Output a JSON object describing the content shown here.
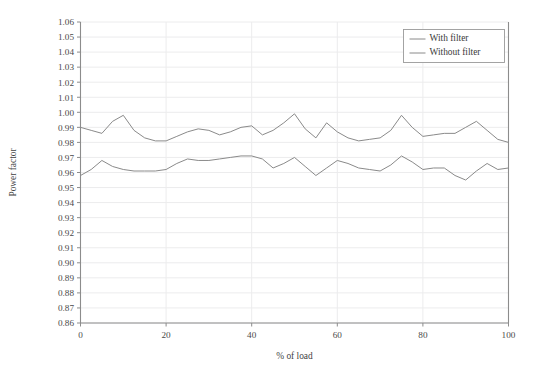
{
  "chart_data": {
    "type": "line",
    "title": "",
    "xlabel": "% of load",
    "ylabel": "Power factor",
    "xlim": [
      0,
      100
    ],
    "ylim": [
      0.86,
      1.06
    ],
    "grid": true,
    "legend_position": "top-right",
    "x_ticks": [
      0,
      20,
      40,
      60,
      80,
      100
    ],
    "x_tick_labels": [
      "0",
      "20",
      "40",
      "60",
      "80",
      "100"
    ],
    "y_ticks": [
      0.86,
      0.87,
      0.88,
      0.89,
      0.9,
      0.91,
      0.92,
      0.93,
      0.94,
      0.95,
      0.96,
      0.97,
      0.98,
      0.99,
      1.0,
      1.01,
      1.02,
      1.03,
      1.04,
      1.05,
      1.06
    ],
    "y_tick_labels": [
      "0.86",
      "0.87",
      "0.88",
      "0.89",
      "0.90",
      "0.91",
      "0.92",
      "0.93",
      "0.94",
      "0.95",
      "0.96",
      "0.97",
      "0.98",
      "0.99",
      "1.00",
      "1.01",
      "1.02",
      "1.03",
      "1.04",
      "1.05",
      "1.06"
    ],
    "x": [
      0,
      2.5,
      5,
      7.5,
      10,
      12.5,
      15,
      17.5,
      20,
      22.5,
      25,
      27.5,
      30,
      32.5,
      35,
      37.5,
      40,
      42.5,
      45,
      47.5,
      50,
      52.5,
      55,
      57.5,
      60,
      62.5,
      65,
      67.5,
      70,
      72.5,
      75,
      77.5,
      80,
      82.5,
      85,
      87.5,
      90,
      92.5,
      95,
      97.5,
      100
    ],
    "series": [
      {
        "name": "With filter",
        "color": "#8a8a8a",
        "values": [
          0.958,
          0.962,
          0.968,
          0.964,
          0.962,
          0.961,
          0.961,
          0.961,
          0.962,
          0.966,
          0.969,
          0.968,
          0.968,
          0.969,
          0.97,
          0.971,
          0.971,
          0.969,
          0.963,
          0.966,
          0.97,
          0.964,
          0.958,
          0.963,
          0.968,
          0.966,
          0.963,
          0.962,
          0.961,
          0.965,
          0.971,
          0.967,
          0.962,
          0.963,
          0.963,
          0.958,
          0.955,
          0.961,
          0.966,
          0.962,
          0.963
        ]
      },
      {
        "name": "Without filter",
        "color": "#8a8a8a",
        "values": [
          0.99,
          0.988,
          0.986,
          0.994,
          0.998,
          0.988,
          0.983,
          0.981,
          0.981,
          0.984,
          0.987,
          0.989,
          0.988,
          0.985,
          0.987,
          0.99,
          0.991,
          0.985,
          0.988,
          0.993,
          0.999,
          0.989,
          0.983,
          0.993,
          0.987,
          0.983,
          0.981,
          0.982,
          0.983,
          0.988,
          0.998,
          0.99,
          0.984,
          0.985,
          0.986,
          0.986,
          0.99,
          0.994,
          0.988,
          0.982,
          0.98
        ]
      }
    ],
    "legend_entries": [
      "With filter",
      "Without filter"
    ]
  },
  "legend": {
    "entries": [
      {
        "label": "With filter"
      },
      {
        "label": "Without filter"
      }
    ]
  },
  "axes": {
    "y_title": "Power factor",
    "x_title": "% of load"
  }
}
